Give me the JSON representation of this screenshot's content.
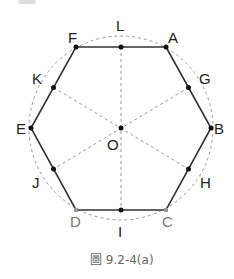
{
  "diagram": {
    "type": "regular hexagon inscribed in circle",
    "center": {
      "label": "O",
      "x": 121,
      "y": 128
    },
    "circle_radius": 92,
    "vertices": [
      {
        "label": "A",
        "x": 166,
        "y": 47,
        "color": "#222"
      },
      {
        "label": "B",
        "x": 211,
        "y": 128,
        "color": "#222"
      },
      {
        "label": "C",
        "x": 166,
        "y": 210,
        "color": "#777"
      },
      {
        "label": "D",
        "x": 76,
        "y": 210,
        "color": "#777"
      },
      {
        "label": "E",
        "x": 31,
        "y": 128,
        "color": "#222"
      },
      {
        "label": "F",
        "x": 76,
        "y": 47,
        "color": "#222"
      }
    ],
    "midpoints": [
      {
        "label": "G",
        "x": 188.5,
        "y": 87.5
      },
      {
        "label": "H",
        "x": 188.5,
        "y": 169
      },
      {
        "label": "I",
        "x": 121,
        "y": 210
      },
      {
        "label": "J",
        "x": 53.5,
        "y": 169
      },
      {
        "label": "K",
        "x": 53.5,
        "y": 87.5
      },
      {
        "label": "L",
        "x": 121,
        "y": 47
      }
    ],
    "labels": {
      "A": "A",
      "B": "B",
      "C": "C",
      "D": "D",
      "E": "E",
      "F": "F",
      "G": "G",
      "H": "H",
      "I": "I",
      "J": "J",
      "K": "K",
      "L": "L",
      "O": "O"
    }
  },
  "caption": "圖 9.2-4(a)",
  "colors": {
    "line": "#333333",
    "dashed": "#999999",
    "label": "#222222",
    "gray_label": "#777777",
    "caption": "#666666"
  }
}
